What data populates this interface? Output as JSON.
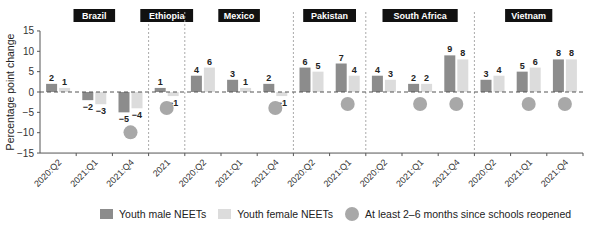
{
  "chart_data": {
    "type": "bar",
    "title": "",
    "ylabel": "Percentage point change",
    "xlabel": "",
    "ylim": [
      -15,
      15
    ],
    "yticks": [
      15,
      10,
      5,
      0,
      -5,
      -10,
      -15
    ],
    "groups": [
      {
        "country": "Brazil",
        "periods": [
          "2020:Q2",
          "2021:Q1",
          "2021:Q4"
        ],
        "male": [
          2,
          -2,
          -5
        ],
        "female": [
          1,
          -3,
          -4
        ],
        "reopened": [
          false,
          false,
          true
        ]
      },
      {
        "country": "Ethiopia",
        "periods": [
          "2021"
        ],
        "male": [
          1
        ],
        "female": [
          -1
        ],
        "reopened": [
          true
        ]
      },
      {
        "country": "Mexico",
        "periods": [
          "2020:Q2",
          "2021:Q1",
          "2021:Q4"
        ],
        "male": [
          4,
          3,
          2
        ],
        "female": [
          6,
          1,
          -1
        ],
        "reopened": [
          false,
          false,
          true
        ]
      },
      {
        "country": "Pakistan",
        "periods": [
          "2020:Q2",
          "2021:Q1"
        ],
        "male": [
          6,
          7
        ],
        "female": [
          5,
          4
        ],
        "reopened": [
          false,
          true
        ]
      },
      {
        "country": "South Africa",
        "periods": [
          "2020:Q2",
          "2021:Q1",
          "2021:Q4"
        ],
        "male": [
          4,
          2,
          9
        ],
        "female": [
          3,
          2,
          8
        ],
        "reopened": [
          false,
          true,
          true
        ]
      },
      {
        "country": "Vietnam",
        "periods": [
          "2020:Q2",
          "2021:Q1",
          "2021:Q4"
        ],
        "male": [
          3,
          5,
          8
        ],
        "female": [
          4,
          6,
          8
        ],
        "reopened": [
          false,
          true,
          true
        ]
      }
    ],
    "series": [
      {
        "name": "Youth male NEETs",
        "color": "#8c8c8c"
      },
      {
        "name": "Youth female NEETs",
        "color": "#dcdcdc"
      }
    ],
    "marker_legend": "At least 2–6 months since schools reopened",
    "marker_color": "#a8a8a8",
    "grid": false,
    "legend_position": "bottom"
  },
  "legend": {
    "male": "Youth male NEETs",
    "female": "Youth female NEETs",
    "reopened": "At least 2–6 months since schools reopened"
  }
}
